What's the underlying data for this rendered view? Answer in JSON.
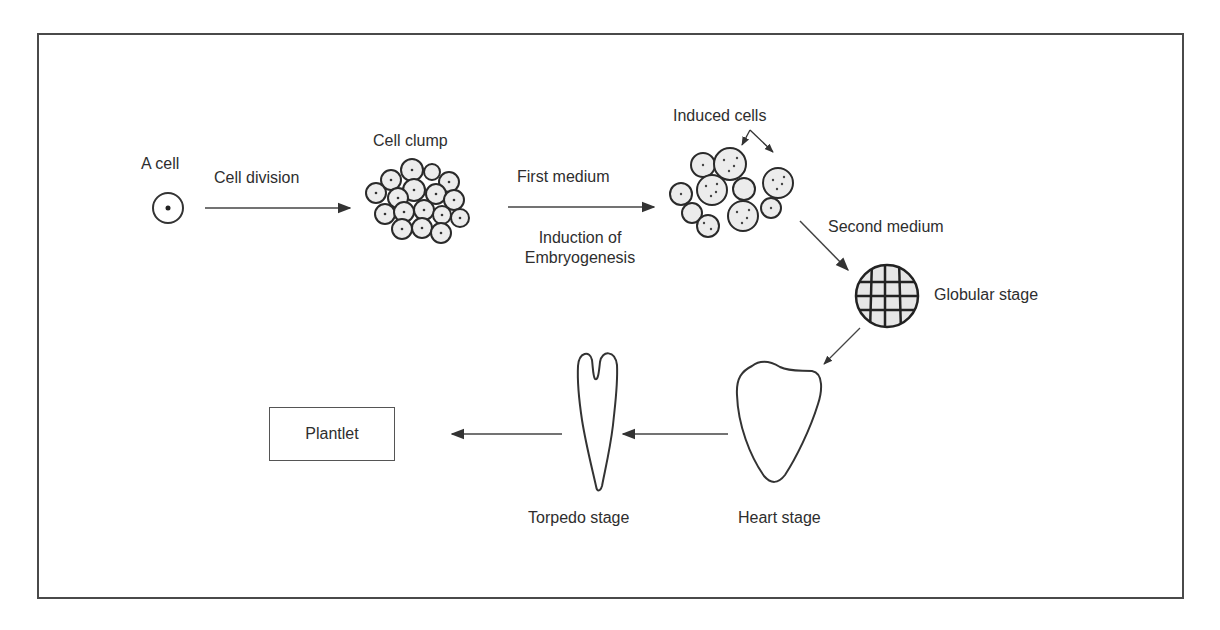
{
  "diagram": {
    "nodes": {
      "a_cell": "A cell",
      "cell_clump": "Cell clump",
      "induced_cells": "Induced cells",
      "globular_stage": "Globular stage",
      "heart_stage": "Heart stage",
      "torpedo_stage": "Torpedo stage",
      "plantlet": "Plantlet"
    },
    "edges": {
      "cell_division": "Cell division",
      "first_medium": "First medium",
      "induction_line1": "Induction of",
      "induction_line2": "Embryogenesis",
      "second_medium": "Second medium"
    },
    "flow": [
      "A cell",
      "Cell clump",
      "Induced cells",
      "Globular stage",
      "Heart stage",
      "Torpedo stage",
      "Plantlet"
    ],
    "colors": {
      "stroke": "#333333",
      "cell_fill": "#ebebeb",
      "background": "#ffffff"
    }
  }
}
